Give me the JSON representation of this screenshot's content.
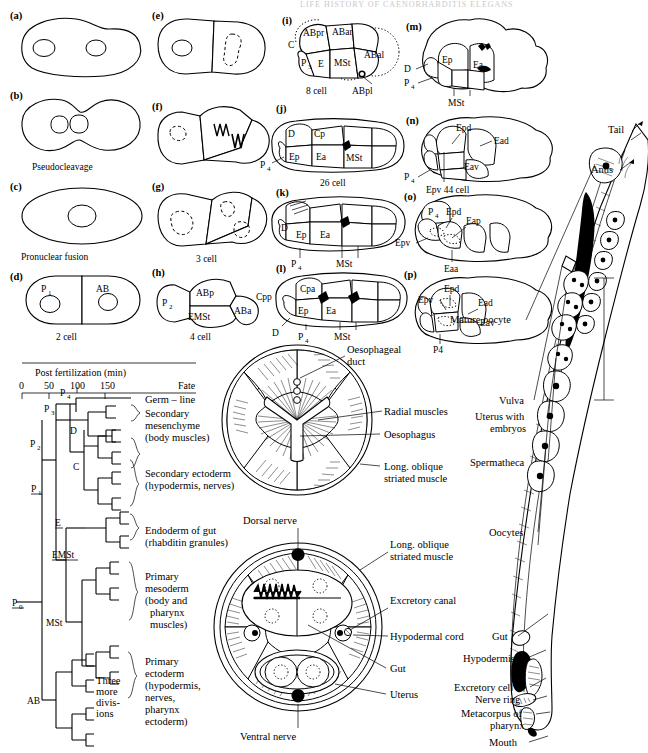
{
  "header": {
    "running_title": "LIFE HISTORY OF CAENORHABDITIS ELEGANS"
  },
  "embryo_panels": [
    {
      "letter": "(a)",
      "caption": "",
      "labels": []
    },
    {
      "letter": "(b)",
      "caption": "Pseudocleavage",
      "labels": []
    },
    {
      "letter": "(c)",
      "caption": "Pronuclear fusion",
      "labels": []
    },
    {
      "letter": "(d)",
      "caption": "2 cell",
      "labels": [
        "P",
        "1",
        "AB"
      ]
    },
    {
      "letter": "(e)",
      "caption": "",
      "labels": []
    },
    {
      "letter": "(f)",
      "caption": "",
      "labels": []
    },
    {
      "letter": "(g)",
      "caption": "3 cell",
      "labels": []
    },
    {
      "letter": "(h)",
      "caption": "4 cell",
      "labels": [
        "P",
        "2",
        "ABp",
        "EMSt",
        "ABa"
      ]
    },
    {
      "letter": "(i)",
      "caption": "8 cell",
      "labels": [
        "C",
        "ABpr",
        "ABar",
        "P",
        "3",
        "E",
        "MSt",
        "ABal",
        "ABpl"
      ]
    },
    {
      "letter": "(j)",
      "caption": "26 cell",
      "labels": [
        "D",
        "Cp",
        "Ep",
        "Ea",
        "MSt",
        "P",
        "4"
      ]
    },
    {
      "letter": "(k)",
      "caption": "",
      "labels": [
        "D",
        "Ep",
        "Ea",
        "P",
        "4",
        "MSt"
      ]
    },
    {
      "letter": "(l)",
      "caption": "",
      "labels": [
        "Cpa",
        "Cpp",
        "Ep",
        "Ea",
        "D",
        "P",
        "4",
        "MSt"
      ]
    },
    {
      "letter": "(m)",
      "caption": "",
      "labels": [
        "Ep",
        "Ea",
        "D",
        "P",
        "4",
        "MSt"
      ]
    },
    {
      "letter": "(n)",
      "caption": "Epv  44 cell",
      "labels": [
        "Epd",
        "Ead",
        "Eav",
        "P",
        "4",
        "Epv"
      ]
    },
    {
      "letter": "(o)",
      "caption": "",
      "labels": [
        "P",
        "4",
        "Epd",
        "Eap",
        "Epv",
        "Eaa"
      ]
    },
    {
      "letter": "(p)",
      "caption": "",
      "labels": [
        "Epd",
        "Epv",
        "Ead",
        "Eav",
        "P4"
      ]
    }
  ],
  "panel_labels": {
    "a": "(a)",
    "b": "(b)",
    "c": "(c)",
    "d": "(d)",
    "e": "(e)",
    "f": "(f)",
    "g": "(g)",
    "h": "(h)",
    "i": "(i)",
    "j": "(j)",
    "k": "(k)",
    "l": "(l)",
    "m": "(m)",
    "n": "(n)",
    "o": "(o)",
    "p": "(p)"
  },
  "captions": {
    "b": "Pseudocleavage",
    "c": "Pronuclear fusion",
    "d": "2 cell",
    "g": "3 cell",
    "h": "4 cell",
    "i": "8 cell",
    "j": "26 cell",
    "n": "Epv  44 cell"
  },
  "cells": {
    "P1": "P",
    "P1s": "1",
    "AB": "AB",
    "P2": "P",
    "P2s": "2",
    "ABp": "ABp",
    "ABa": "ABa",
    "EMSt": "EMSt",
    "C": "C",
    "ABpr": "ABpr",
    "ABar": "ABar",
    "P3": "P",
    "P3s": "3",
    "E": "E",
    "MSt": "MSt",
    "ABal": "ABal",
    "ABpl": "ABpl",
    "D": "D",
    "Cp": "Cp",
    "Ep": "Ep",
    "Ea": "Ea",
    "P4": "P",
    "P4s": "4",
    "P4plain": "P4",
    "Cpa": "Cpa",
    "Cpp": "Cpp",
    "Epd": "Epd",
    "Ead": "Ead",
    "Eav": "Eav",
    "Epv": "Epv",
    "Eap": "Eap",
    "Eaa": "Eaa"
  },
  "lineage": {
    "axis_title": "Post fertilization (min)",
    "fate_header": "Fate",
    "ticks": [
      "0",
      "50",
      "100",
      "150"
    ],
    "nodes": {
      "P0": "P",
      "P0s": "0",
      "P1": "P",
      "P1s": "1",
      "P2": "P",
      "P2s": "2",
      "P3": "P",
      "P3s": "3",
      "P4": "P",
      "P4s": "4",
      "D": "D",
      "C": "C",
      "E": "E",
      "EMSt": "EMSt",
      "MSt": "MSt",
      "AB": "AB"
    },
    "three_more": [
      "Three",
      "more",
      "divis-",
      "ions"
    ],
    "fates": [
      {
        "id": "germ-line",
        "lines": [
          "Germ – line"
        ]
      },
      {
        "id": "secondary-mesenchyme",
        "lines": [
          "Secondary",
          "mesenchyme",
          "(body muscles)"
        ]
      },
      {
        "id": "secondary-ectoderm",
        "lines": [
          "Secondary ectoderm",
          "(hypodermis, nerves)"
        ]
      },
      {
        "id": "endoderm-of-gut",
        "lines": [
          "Endoderm of gut",
          "(rhabditin granules)"
        ]
      },
      {
        "id": "primary-mesoderm",
        "lines": [
          "Primary",
          "mesoderm",
          "(body and",
          "pharynx",
          "muscles)"
        ]
      },
      {
        "id": "primary-ectoderm",
        "lines": [
          "Primary",
          "ectoderm",
          "(hypodermis,",
          "nerves,",
          "pharynx",
          "ectoderm)"
        ]
      }
    ]
  },
  "cross_section_pharynx": {
    "labels": [
      {
        "id": "oesophageal-duct",
        "lines": [
          "Oesophageal",
          "duct"
        ]
      },
      {
        "id": "radial-muscles",
        "lines": [
          "Radial muscles"
        ]
      },
      {
        "id": "oesophagus",
        "lines": [
          "Oesophagus"
        ]
      },
      {
        "id": "long-oblique-striated-muscle",
        "lines": [
          "Long. oblique",
          "striated muscle"
        ]
      }
    ]
  },
  "cross_section_body": {
    "labels": [
      {
        "id": "dorsal-nerve",
        "lines": [
          "Dorsal nerve"
        ]
      },
      {
        "id": "long-oblique-striated-muscle",
        "lines": [
          "Long. oblique",
          "striated muscle"
        ]
      },
      {
        "id": "excretory-canal",
        "lines": [
          "Excretory canal"
        ]
      },
      {
        "id": "hypodermal-cord",
        "lines": [
          "Hypodermal cord"
        ]
      },
      {
        "id": "gut",
        "lines": [
          "Gut"
        ]
      },
      {
        "id": "uterus",
        "lines": [
          "Uterus"
        ]
      },
      {
        "id": "ventral-nerve",
        "lines": [
          "Ventral nerve"
        ]
      }
    ]
  },
  "adult_worm": {
    "labels": [
      {
        "id": "tail",
        "lines": [
          "Tail"
        ]
      },
      {
        "id": "anus",
        "lines": [
          "Anus"
        ]
      },
      {
        "id": "mature-oocyte",
        "lines": [
          "Mature oocyte"
        ]
      },
      {
        "id": "vulva",
        "lines": [
          "Vulva"
        ]
      },
      {
        "id": "uterus-with-embryos",
        "lines": [
          "Uterus with",
          "embryos"
        ]
      },
      {
        "id": "spermatheca",
        "lines": [
          "Spermatheca"
        ]
      },
      {
        "id": "oocytes",
        "lines": [
          "Oocytes"
        ]
      },
      {
        "id": "gut",
        "lines": [
          "Gut"
        ]
      },
      {
        "id": "hypodermis",
        "lines": [
          "Hypodermis"
        ]
      },
      {
        "id": "excretory-cell",
        "lines": [
          "Excretory cell"
        ]
      },
      {
        "id": "nerve-ring",
        "lines": [
          "Nerve ring"
        ]
      },
      {
        "id": "metacorpus-of-pharynx",
        "lines": [
          "Metacorpus of",
          "pharynx"
        ]
      },
      {
        "id": "mouth",
        "lines": [
          "Mouth"
        ]
      }
    ]
  },
  "colors": {
    "ink": "#000000",
    "paper": "#ffffff"
  }
}
